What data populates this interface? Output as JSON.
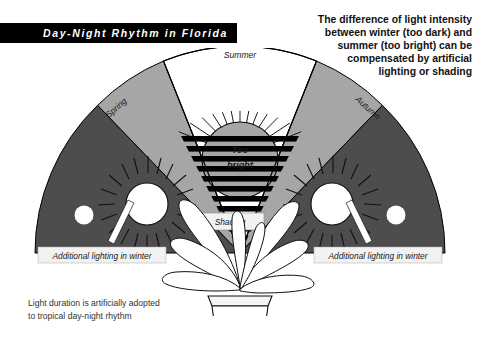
{
  "title_banner": {
    "text": "Day-Night Rhythm in Florida",
    "background": "#000000",
    "text_color": "#ffffff"
  },
  "intro_text": {
    "lines": [
      "The difference of light intensity",
      "between winter (too dark) and",
      "summer (too bright) can be",
      "compensated by artificial",
      "lighting or shading"
    ],
    "full": "The difference of light intensity between winter (too dark) and summer (too bright) can be compensated by artificial lighting or shading"
  },
  "bottom_caption": {
    "line1": "Light duration is artificially adopted",
    "line2": "to tropical day-night rhythm"
  },
  "diagram": {
    "season_labels": {
      "summer": "Summer",
      "spring": "Spring",
      "autumn": "Autumn"
    },
    "callouts": {
      "too_bright_line1": "Too",
      "too_bright_line2": "bright",
      "shading": "Shading",
      "winter_left": "Additional lighting in winter",
      "winter_right": "Additional lighting in winter"
    },
    "colors": {
      "wedge_winter_dark": "#4d4d4d",
      "wedge_season_gray": "#a6a6a6",
      "wedge_summer_white": "#ffffff",
      "stripe_dark": "#000000",
      "stripe_light": "#ffffff",
      "sun_fill": "#ffffff",
      "too_bright_fill": "#a6a6a6",
      "outline": "#000000",
      "label_box": "#f2f2f2"
    },
    "stripe_count": 13
  }
}
